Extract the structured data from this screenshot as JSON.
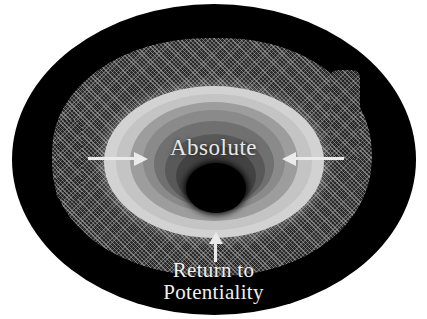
{
  "figure": {
    "center_label": "Absolute",
    "caption": {
      "line1": "Return to",
      "line2": "Potentiality"
    },
    "arrows": [
      {
        "name": "left-arrow",
        "direction": "right",
        "meaning": "inward"
      },
      {
        "name": "right-arrow",
        "direction": "left",
        "meaning": "inward"
      },
      {
        "name": "bottom-arrow",
        "direction": "up",
        "meaning": "inward"
      }
    ],
    "colors": {
      "background": "#ffffff",
      "void": "#000000",
      "texture": "#2d2d2d",
      "ring_1": "#d2d2d2",
      "ring_2": "#c4c4c4",
      "ring_3": "#9d9d9d",
      "ring_4": "#8a8a8a",
      "ring_5": "#707070",
      "ring_6": "#595959",
      "ring_7": "#434343",
      "core": "#000000",
      "label_text": "#e8e8e8",
      "arrow": "#eaeaea"
    }
  }
}
